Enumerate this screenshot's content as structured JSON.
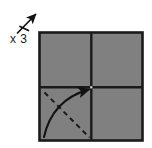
{
  "figure": {
    "type": "origami-step-diagram",
    "background_color": "#ffffff",
    "repeat_symbol": {
      "label": "x 3",
      "icon": "repeat-arrow-icon",
      "tick_count": 1,
      "arrow_direction": "up-right",
      "stroke_color": "#121212"
    },
    "paper": {
      "shape": "square",
      "fill_color": "#808080",
      "border_color": "#1a1a1a",
      "crease_color": "#1a1a1a",
      "quadrants": [
        {
          "name": "top-left",
          "fill_color": "#808080"
        },
        {
          "name": "top-right",
          "fill_color": "#808080"
        },
        {
          "name": "bottom-left",
          "fill_color": "#808080"
        },
        {
          "name": "bottom-right",
          "fill_color": "#808080"
        }
      ],
      "creases": [
        {
          "name": "vertical-crease",
          "orientation": "vertical"
        },
        {
          "name": "horizontal-crease",
          "orientation": "horizontal"
        }
      ]
    },
    "annotations": [
      {
        "name": "valley-fold-dashed-line",
        "style": "dashed",
        "from": "upper-left",
        "to": "lower-right",
        "quadrant": "bottom-left",
        "stroke_color": "#1a1a1a"
      },
      {
        "name": "fold-direction-curved-arrow",
        "style": "solid-curved",
        "from": "lower-left",
        "to": "center",
        "quadrant": "bottom-left",
        "stroke_color": "#121212",
        "arrowhead": true
      }
    ]
  }
}
